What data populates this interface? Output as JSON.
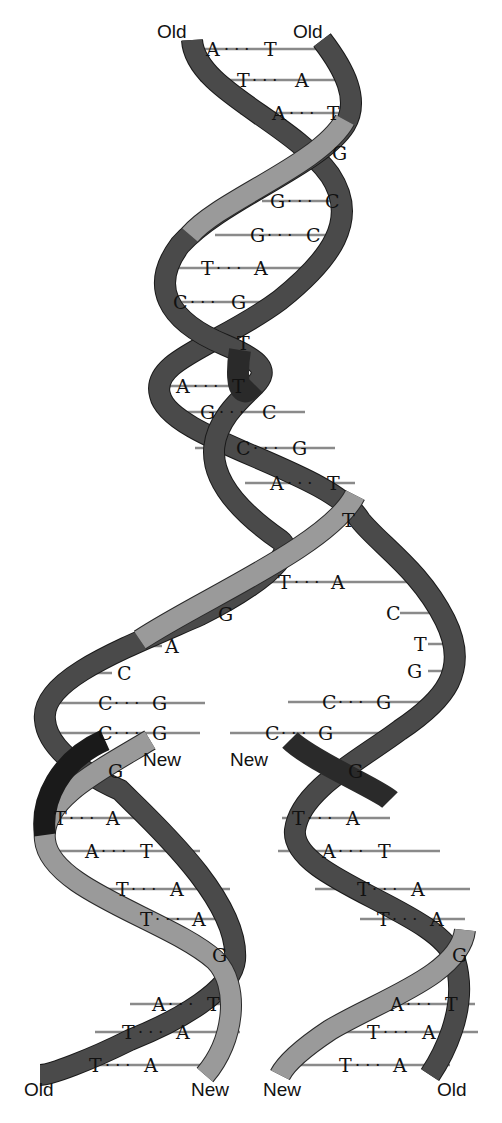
{
  "diagram": {
    "colors": {
      "old_strand": "#4a4a4a",
      "new_strand": "#9a9a9a",
      "bond": "#8a8a8a",
      "text": "#111111"
    },
    "labels": {
      "top_left": "Old",
      "top_right": "Old",
      "fork_left_new": "New",
      "fork_right_new": "New",
      "bottom_left_old": "Old",
      "bottom_left_new": "New",
      "bottom_right_new": "New",
      "bottom_right_old": "Old"
    },
    "parent_helix": {
      "pairs": [
        {
          "left": "A",
          "right": "T"
        },
        {
          "left": "T",
          "right": "A"
        },
        {
          "left": "A",
          "right": "T"
        },
        {
          "single": "G"
        },
        {
          "left": "G",
          "right": "C"
        },
        {
          "left": "G",
          "right": "C"
        },
        {
          "left": "T",
          "right": "A"
        },
        {
          "left": "C",
          "right": "G"
        },
        {
          "single": "T"
        },
        {
          "left": "A",
          "right": "T"
        },
        {
          "left": "G",
          "right": "C"
        },
        {
          "left": "C",
          "right": "G"
        },
        {
          "left": "A",
          "right": "T"
        },
        {
          "single": "T"
        },
        {
          "left": "T",
          "right": "A"
        }
      ]
    },
    "fork": {
      "left_unpaired": [
        "G",
        "A",
        "C"
      ],
      "right_unpaired": [
        "C",
        "T",
        "G"
      ],
      "left_pairs": [
        {
          "left": "C",
          "right": "G"
        },
        {
          "left": "C",
          "right": "G"
        }
      ],
      "right_pairs": [
        {
          "left": "C",
          "right": "G"
        },
        {
          "left": "C",
          "right": "G"
        }
      ]
    },
    "daughter_left": {
      "pairs": [
        {
          "single": "G"
        },
        {
          "left": "T",
          "right": "A"
        },
        {
          "left": "A",
          "right": "T"
        },
        {
          "left": "T",
          "right": "A"
        },
        {
          "left": "T",
          "right": "A"
        },
        {
          "single": "G"
        },
        {
          "left": "A",
          "right": "T"
        },
        {
          "left": "T",
          "right": "A"
        },
        {
          "left": "T",
          "right": "A"
        }
      ]
    },
    "daughter_right": {
      "pairs": [
        {
          "single": "G"
        },
        {
          "left": "T",
          "right": "A"
        },
        {
          "left": "A",
          "right": "T"
        },
        {
          "left": "T",
          "right": "A"
        },
        {
          "left": "T",
          "right": "A"
        },
        {
          "single": "G"
        },
        {
          "left": "A",
          "right": "T"
        },
        {
          "left": "T",
          "right": "A"
        },
        {
          "left": "T",
          "right": "A"
        }
      ]
    },
    "dots": "· · ·"
  }
}
